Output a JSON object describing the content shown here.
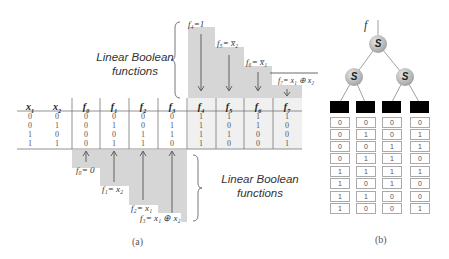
{
  "panel_a": {
    "caption": "(a)",
    "headers": [
      "x1",
      "x2",
      "f0",
      "f1",
      "f2",
      "f3",
      "f4",
      "f5",
      "f6",
      "f7"
    ],
    "header_display": [
      {
        "base": "x",
        "sub": "1"
      },
      {
        "base": "x",
        "sub": "2"
      },
      {
        "base": "f",
        "sub": "0"
      },
      {
        "base": "f",
        "sub": "1"
      },
      {
        "base": "f",
        "sub": "2"
      },
      {
        "base": "f",
        "sub": "3"
      },
      {
        "base": "f",
        "sub": "4"
      },
      {
        "base": "f",
        "sub": "5"
      },
      {
        "base": "f",
        "sub": "6"
      },
      {
        "base": "f",
        "sub": "7"
      }
    ],
    "rows": [
      [
        "0",
        "0",
        "0",
        "0",
        "0",
        "0",
        "1",
        "1",
        "1",
        "1"
      ],
      [
        "0",
        "1",
        "0",
        "1",
        "0",
        "1",
        "1",
        "0",
        "1",
        "0"
      ],
      [
        "1",
        "0",
        "0",
        "0",
        "1",
        "1",
        "1",
        "1",
        "0",
        "0"
      ],
      [
        "1",
        "1",
        "0",
        "1",
        "1",
        "0",
        "1",
        "0",
        "0",
        "1"
      ]
    ],
    "top_group_label_line1": "Linear Boolean",
    "top_group_label_line2": "functions",
    "bottom_group_label_line1": "Linear Boolean",
    "bottom_group_label_line2": "functions",
    "top_functions": [
      {
        "name": "f4",
        "label": "f₄=1"
      },
      {
        "name": "f5",
        "label": "f₅=  x̅₂"
      },
      {
        "name": "f6",
        "label": "f₆=  x̅₁"
      },
      {
        "name": "f7",
        "label": "f₇= x₁ ⊕ x₂"
      }
    ],
    "bottom_functions": [
      {
        "name": "f0",
        "label": "f₀= 0"
      },
      {
        "name": "f1",
        "label": "f₁= x₂"
      },
      {
        "name": "f2",
        "label": "f₂= x₁"
      },
      {
        "name": "f3",
        "label": "f₃= x₁ ⊕ x₂"
      }
    ]
  },
  "panel_b": {
    "caption": "(b)",
    "root_label": "f",
    "node_label": "S",
    "columns": [
      [
        "0",
        "0",
        "0",
        "0",
        "1",
        "1",
        "1",
        "1"
      ],
      [
        "0",
        "1",
        "0",
        "1",
        "1",
        "0",
        "1",
        "0"
      ],
      [
        "0",
        "0",
        "1",
        "1",
        "1",
        "1",
        "0",
        "0"
      ],
      [
        "0",
        "1",
        "1",
        "0",
        "1",
        "0",
        "0",
        "1"
      ]
    ]
  },
  "colors": {
    "shade": "#d4d4d4",
    "line": "#777777",
    "text": "#333333"
  }
}
